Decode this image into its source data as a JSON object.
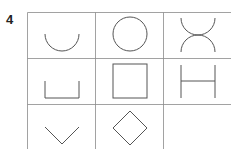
{
  "question_number": "4",
  "grid": {
    "rows": 3,
    "cols": 3,
    "cells": [
      {
        "row": 0,
        "col": 0,
        "shape": "semicircle-cup"
      },
      {
        "row": 0,
        "col": 1,
        "shape": "circle"
      },
      {
        "row": 0,
        "col": 2,
        "shape": "two-arcs-x"
      },
      {
        "row": 1,
        "col": 0,
        "shape": "square-cup"
      },
      {
        "row": 1,
        "col": 1,
        "shape": "square"
      },
      {
        "row": 1,
        "col": 2,
        "shape": "h-shape"
      },
      {
        "row": 2,
        "col": 0,
        "shape": "v-shape"
      },
      {
        "row": 2,
        "col": 1,
        "shape": "diamond"
      },
      {
        "row": 2,
        "col": 2,
        "shape": "empty"
      }
    ]
  },
  "colors": {
    "line": "#555555",
    "grid": "#888888"
  }
}
